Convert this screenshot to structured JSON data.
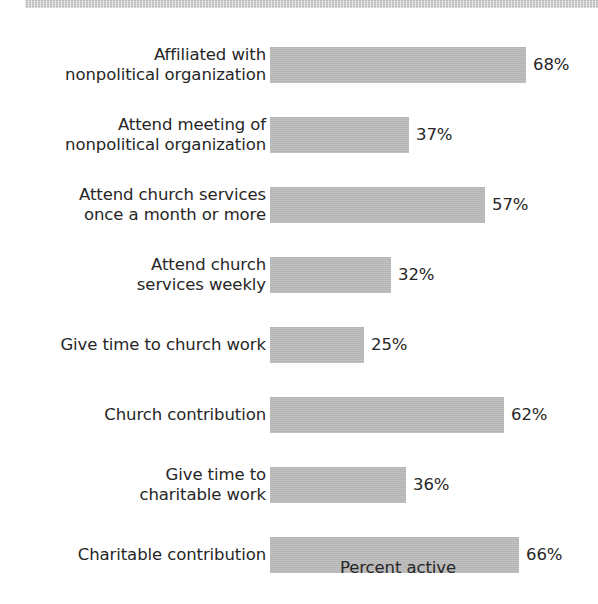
{
  "decor": {
    "top_band": "textured-gray-band"
  },
  "chart_data": {
    "type": "bar",
    "orientation": "horizontal",
    "title": "",
    "subtitle": "",
    "xlabel": "Percent active",
    "ylabel": "",
    "grid": false,
    "legend": null,
    "xlim": [
      0,
      70
    ],
    "value_suffix": "%",
    "bar_color": "#b9b9b9",
    "text_color": "#262626",
    "categories": [
      "Affiliated with\nnonpolitical organization",
      "Attend meeting of\nnonpolitical organization",
      "Attend church services\nonce a month or more",
      "Attend church\nservices weekly",
      "Give time to church work",
      "Church contribution",
      "Give time to\ncharitable work",
      "Charitable contribution"
    ],
    "values": [
      68,
      37,
      57,
      32,
      25,
      62,
      36,
      66
    ],
    "value_labels": [
      "68%",
      "37%",
      "57%",
      "32%",
      "25%",
      "62%",
      "36%",
      "66%"
    ]
  },
  "layout": {
    "bar_origin_x": 270,
    "px_per_percent": 3.77,
    "bar_height": 36,
    "row_pitch": 70,
    "first_row_top": 47,
    "value_gap": 7
  }
}
